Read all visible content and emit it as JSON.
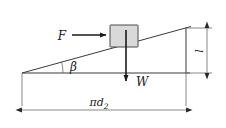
{
  "figure": {
    "background_color": "#ffffff",
    "line_color": "#3a3a3a",
    "block_fill_color": "#d9d9d9",
    "arrow_color": "#1a1a1a"
  },
  "labels": {
    "force": "F",
    "weight": "W",
    "angle": "β",
    "base_dimension": "πd",
    "base_dimension_subscript": "2",
    "height_dimension": "l"
  },
  "elements": {
    "incline_name": "inclined-plane-hypotenuse",
    "base_name": "horizontal-base-line",
    "vertical_name": "right-vertical-line",
    "block_name": "sliding-block",
    "force_arrow_name": "force-arrow-horizontal",
    "weight_arrow_name": "weight-arrow-vertical",
    "angle_arc_name": "lead-angle-arc",
    "base_dim_name": "base-dimension-line",
    "height_dim_name": "height-dimension-line"
  },
  "geometry": {
    "apex_x": 22,
    "apex_y": 73,
    "right_top_x": 186,
    "right_top_y": 28,
    "right_bottom_x": 186,
    "right_bottom_y": 73,
    "block_left": 110,
    "block_top": 25,
    "block_width": 28,
    "block_height": 22,
    "force_arrow_start_x": 72,
    "force_arrow_end_x": 107,
    "force_arrow_y": 35,
    "weight_arrow_x": 126,
    "weight_arrow_top_y": 30,
    "weight_arrow_bottom_y": 83,
    "base_dim_y": 110,
    "base_dim_left_x": 22,
    "base_dim_right_x": 186,
    "height_dim_x": 207,
    "height_dim_top_y": 28,
    "height_dim_bottom_y": 73
  }
}
